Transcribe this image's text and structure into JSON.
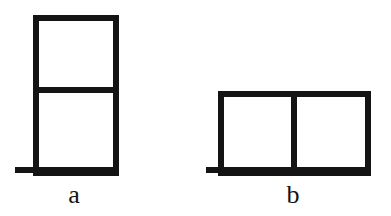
{
  "figure": {
    "background_color": "#ffffff",
    "stroke_color": "#141414",
    "stroke_width": 6,
    "canvas": {
      "width": 391,
      "height": 216
    },
    "panels": [
      {
        "id": "a",
        "label": "a",
        "label_x": 74,
        "label_y": 195,
        "arrangement": "vertical-stack",
        "cell_count": 2,
        "description": "two square cells stacked vertically on a base plate",
        "outline": {
          "x": 36,
          "y": 18,
          "width": 80,
          "height": 155
        },
        "dividers": [
          {
            "orientation": "horizontal",
            "x1": 36,
            "y1": 90,
            "x2": 116,
            "y2": 90
          }
        ],
        "base_plate": {
          "x1": 15,
          "y1": 170,
          "x2": 116,
          "y2": 170
        },
        "cells": [
          {
            "index": 0,
            "x": 36,
            "y": 18,
            "width": 80,
            "height": 72
          },
          {
            "index": 1,
            "x": 36,
            "y": 90,
            "width": 80,
            "height": 83
          }
        ]
      },
      {
        "id": "b",
        "label": "b",
        "label_x": 293,
        "label_y": 195,
        "arrangement": "horizontal-row",
        "cell_count": 2,
        "description": "two square cells side by side on a base plate",
        "outline": {
          "x": 221,
          "y": 94,
          "width": 147,
          "height": 79
        },
        "dividers": [
          {
            "orientation": "vertical",
            "x1": 294,
            "y1": 94,
            "x2": 294,
            "y2": 173
          }
        ],
        "base_plate": {
          "x1": 206,
          "y1": 170,
          "x2": 368,
          "y2": 170
        },
        "cells": [
          {
            "index": 0,
            "x": 221,
            "y": 94,
            "width": 73,
            "height": 79
          },
          {
            "index": 1,
            "x": 294,
            "y": 94,
            "width": 74,
            "height": 79
          }
        ]
      }
    ]
  }
}
